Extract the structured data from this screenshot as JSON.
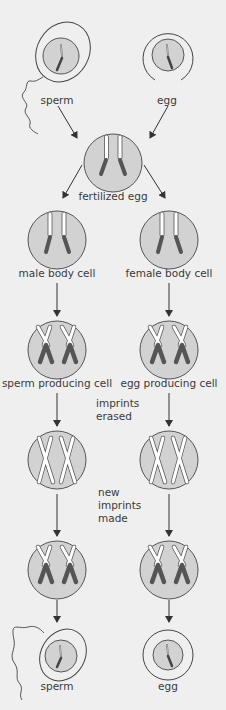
{
  "diagram": {
    "colors": {
      "background": "#efefef",
      "cell_fill": "#d2d2d2",
      "cell_stroke": "#555555",
      "paternal_chromosome": "#ffffff",
      "maternal_chromosome": "#5a5a5a",
      "arrow": "#333333"
    },
    "top": {
      "sperm_label": "sperm",
      "egg_label": "egg"
    },
    "fertilized": {
      "label": "fertilized egg"
    },
    "body_cells": {
      "male_label": "male body cell",
      "female_label": "female body cell"
    },
    "germ_cells": {
      "male_label": "sperm producing cell",
      "female_label": "egg producing cell"
    },
    "steps": {
      "erase_line1": "imprints",
      "erase_line2": "erased",
      "new_line1": "new",
      "new_line2": "imprints",
      "new_line3": "made"
    },
    "bottom": {
      "sperm_label": "sperm",
      "egg_label": "egg"
    }
  }
}
